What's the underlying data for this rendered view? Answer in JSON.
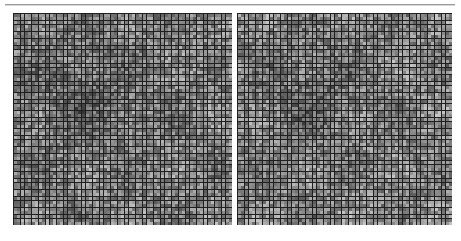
{
  "figure": {
    "title": "",
    "background_color": "#ffffff",
    "rule": {
      "name": "top-horizontal-rule",
      "color": "#9a9a9e",
      "x": 5,
      "y": 4,
      "width": 450,
      "height": 1
    }
  },
  "chart_data": [
    {
      "type": "heatmap",
      "id": "left-matrix",
      "title": "",
      "subtitle": "",
      "xlabel": "",
      "ylabel": "",
      "grid": true,
      "legend": "none",
      "colormap": "grayscale",
      "value_range": [
        0,
        1
      ],
      "color_low": "#2e2e2e",
      "color_high": "#c8c8c8",
      "cell_border_color": "#1f1f1f",
      "rows": 59,
      "cols": 61,
      "cell_size_px": 3.6,
      "x_tick_labels": [],
      "y_tick_labels": [],
      "annotations": [],
      "bounds": {
        "x": 13,
        "y": 13,
        "width": 219,
        "height": 212
      },
      "seed": 1337,
      "mean_value": 0.42,
      "description": "Dense grayscale matrix of pseudo-random intensity cells with a darker mid-left cluster"
    },
    {
      "type": "heatmap",
      "id": "right-matrix",
      "title": "",
      "subtitle": "",
      "xlabel": "",
      "ylabel": "",
      "grid": true,
      "legend": "none",
      "colormap": "grayscale",
      "value_range": [
        0,
        1
      ],
      "color_low": "#2e2e2e",
      "color_high": "#c8c8c8",
      "cell_border_color": "#1f1f1f",
      "rows": 59,
      "cols": 60,
      "cell_size_px": 3.6,
      "x_tick_labels": [],
      "y_tick_labels": [],
      "annotations": [],
      "bounds": {
        "x": 237,
        "y": 13,
        "width": 215,
        "height": 212
      },
      "seed": 8642,
      "mean_value": 0.45,
      "description": "Dense grayscale matrix of pseudo-random intensity cells, slightly lighter overall than the left matrix"
    }
  ]
}
